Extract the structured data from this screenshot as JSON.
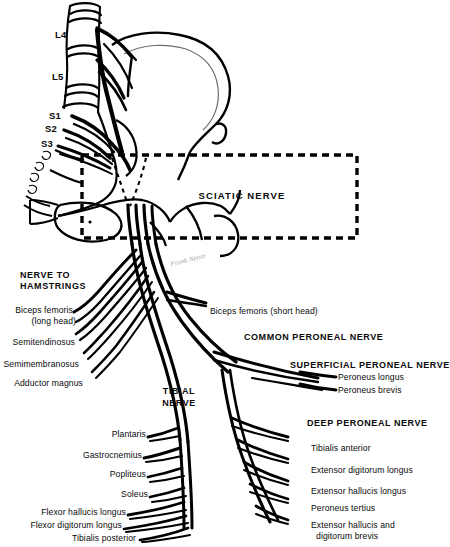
{
  "figure": {
    "background_color": "#ffffff",
    "ink_color": "#000000"
  },
  "spine_roots": {
    "group_name": "lumbosacral-plexus-roots",
    "items": [
      {
        "label": "L4",
        "x": 55,
        "y": 35
      },
      {
        "label": "L5",
        "x": 52,
        "y": 77
      },
      {
        "label": "S1",
        "x": 49,
        "y": 116
      },
      {
        "label": "S2",
        "x": 46,
        "y": 128
      },
      {
        "label": "S3",
        "x": 43,
        "y": 143
      }
    ]
  },
  "sciatic_box": {
    "label": "SCIATIC NERVE",
    "x": 82,
    "y": 155,
    "width": 275,
    "height": 83,
    "border_style": "dashed",
    "border_color": "#000000"
  },
  "hamstring_group": {
    "heading_line1": "NERVE TO",
    "heading_line2": "HAMSTRINGS",
    "branches": [
      {
        "label": "Biceps femoris",
        "label2": "(long head)"
      },
      {
        "label": "Semitendinosus"
      },
      {
        "label": "Semimembranosus"
      },
      {
        "label": "Adductor magnus"
      }
    ]
  },
  "tibial_nerve": {
    "heading_line1": "TIBIAL",
    "heading_line2": "NERVE",
    "branches": [
      {
        "label": "Plantaris"
      },
      {
        "label": "Gastrocnemius"
      },
      {
        "label": "Popliteus"
      },
      {
        "label": "Soleus"
      },
      {
        "label": "Flexor hallucis longus"
      },
      {
        "label": "Flexor digitorum longus"
      },
      {
        "label": "Tibialis posterior"
      }
    ]
  },
  "common_peroneal_nerve": {
    "heading": "COMMON PERONEAL NERVE",
    "direct_branch": "Biceps femoris (short head)"
  },
  "superficial_peroneal_nerve": {
    "heading": "SUPERFICIAL PERONEAL NERVE",
    "branches": [
      {
        "label": "Peroneus longus"
      },
      {
        "label": "Peroneus brevis"
      }
    ]
  },
  "deep_peroneal_nerve": {
    "heading": "DEEP PERONEAL NERVE",
    "branches": [
      {
        "label": "Tibialis anterior"
      },
      {
        "label": "Extensor digitorum longus"
      },
      {
        "label": "Extensor hallucis longus"
      },
      {
        "label": "Peroneus tertius"
      },
      {
        "label": "Extensor hallucis and",
        "label2": "digitorum brevis"
      }
    ]
  },
  "artist_signature": {
    "text": "Frank Netter"
  }
}
